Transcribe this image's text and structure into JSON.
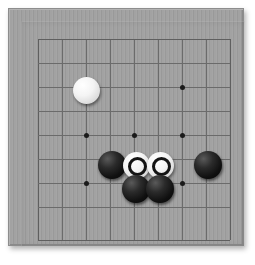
{
  "app": {
    "title": "Go Board",
    "kind": "go-board-photograph"
  },
  "board": {
    "game": "Go",
    "grid_columns": 9,
    "grid_rows": 9,
    "column_labels": [
      "A",
      "B",
      "C",
      "D",
      "E",
      "F",
      "G",
      "H",
      "J"
    ],
    "row_labels": [
      "9",
      "8",
      "7",
      "6",
      "5",
      "4",
      "3",
      "2",
      "1"
    ],
    "surface_color": "#a0a0a0",
    "line_color": "#6b6b6b",
    "frame_color": "#8d8d8d",
    "black_stone_color": "#141414",
    "white_stone_color": "#f2f2f2",
    "marker_color": "#141414",
    "geometry": {
      "grid_left": 30,
      "grid_top": 31,
      "cell_size": 24,
      "lines": 9
    },
    "star_points": [
      {
        "name": "star-point-c7",
        "col": 2,
        "row": 2
      },
      {
        "name": "star-point-g7",
        "col": 6,
        "row": 2
      },
      {
        "name": "star-point-c5",
        "col": 2,
        "row": 4
      },
      {
        "name": "star-point-e5",
        "col": 4,
        "row": 4
      },
      {
        "name": "star-point-g5",
        "col": 6,
        "row": 4
      },
      {
        "name": "star-point-c3",
        "col": 2,
        "row": 6
      },
      {
        "name": "star-point-g3",
        "col": 6,
        "row": 6
      }
    ],
    "stones": [
      {
        "name": "white-stone-c8",
        "color": "white",
        "marked": false,
        "col": 2,
        "row": 2,
        "x": 78,
        "y": 82
      },
      {
        "name": "black-stone-d4",
        "color": "black",
        "marked": false,
        "col": 3,
        "row": 5,
        "x": 104,
        "y": 157
      },
      {
        "name": "white-stone-e4-marked",
        "color": "white",
        "marked": true,
        "col": 4,
        "row": 5,
        "x": 128,
        "y": 157
      },
      {
        "name": "white-stone-f4-marked",
        "color": "white",
        "marked": true,
        "col": 5,
        "row": 5,
        "x": 152,
        "y": 157
      },
      {
        "name": "black-stone-g4",
        "color": "black",
        "marked": false,
        "col": 7,
        "row": 5,
        "x": 200,
        "y": 157
      },
      {
        "name": "black-stone-e3",
        "color": "black",
        "marked": false,
        "col": 4,
        "row": 6,
        "x": 128,
        "y": 181
      },
      {
        "name": "black-stone-f3",
        "color": "black",
        "marked": false,
        "col": 5,
        "row": 6,
        "x": 152,
        "y": 181
      }
    ],
    "counts": {
      "black_stones": 4,
      "white_stones": 3,
      "marked_stones": 2
    }
  }
}
